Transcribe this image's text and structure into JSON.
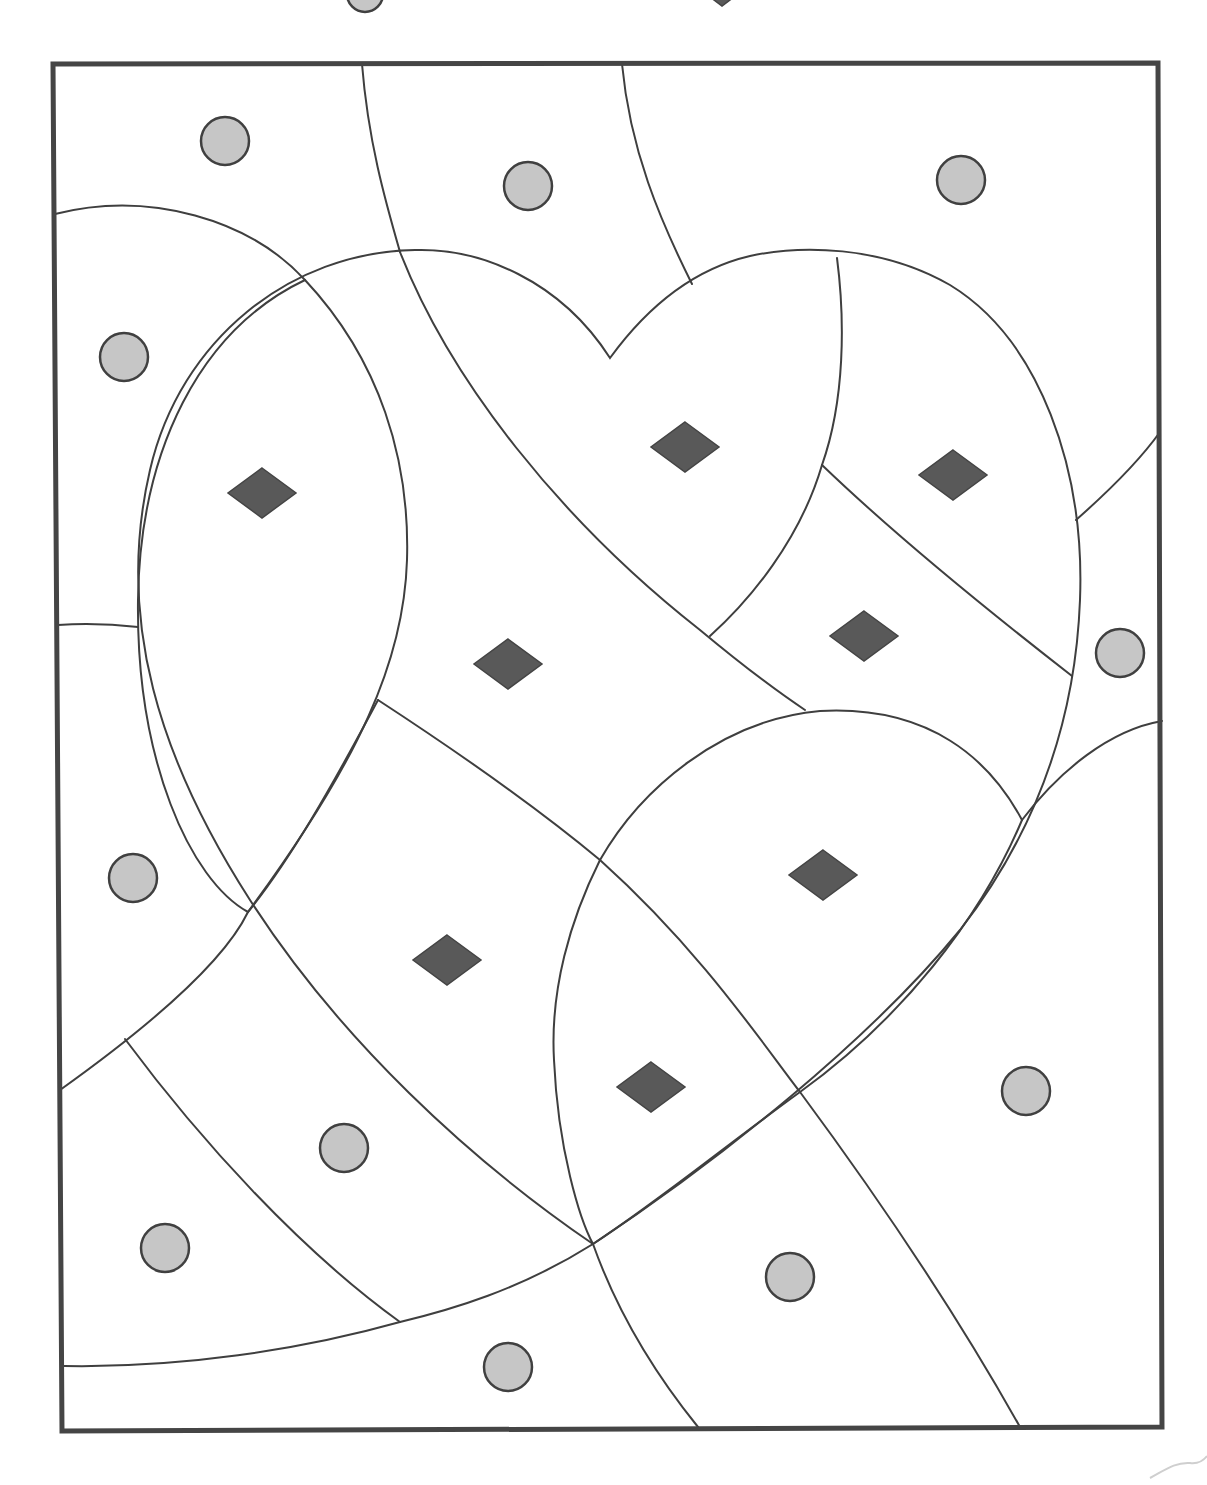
{
  "page": {
    "type": "coloring-page",
    "background": "#ffffff"
  },
  "legend_top_cropped": {
    "circle_symbol": {
      "x": 365,
      "y": -6,
      "r": 18
    },
    "diamond_symbol_tip": {
      "x": 722,
      "y": 6
    }
  },
  "colors": {
    "outline": "#3f3f3f",
    "frame": "#454545",
    "circle_fill": "#c6c6c6",
    "diamond_fill": "#595959"
  },
  "frame": {
    "points": "53,64 1158,63 1162,1427 62,1431"
  },
  "circles": [
    {
      "x": 225,
      "y": 141
    },
    {
      "x": 528,
      "y": 186
    },
    {
      "x": 961,
      "y": 180
    },
    {
      "x": 124,
      "y": 357
    },
    {
      "x": 1120,
      "y": 653
    },
    {
      "x": 133,
      "y": 878
    },
    {
      "x": 1026,
      "y": 1091
    },
    {
      "x": 344,
      "y": 1148
    },
    {
      "x": 165,
      "y": 1248
    },
    {
      "x": 790,
      "y": 1277
    },
    {
      "x": 508,
      "y": 1367
    }
  ],
  "diamonds": [
    {
      "x": 262,
      "y": 493
    },
    {
      "x": 685,
      "y": 447
    },
    {
      "x": 953,
      "y": 475
    },
    {
      "x": 508,
      "y": 664
    },
    {
      "x": 864,
      "y": 636
    },
    {
      "x": 823,
      "y": 875
    },
    {
      "x": 447,
      "y": 960
    },
    {
      "x": 651,
      "y": 1087
    }
  ],
  "shapes": {
    "heart": "M 610 358 C 560 280 480 248 415 250 C 290 252 180 340 150 470 C 115 620 160 760 250 900 C 340 1040 470 1160 593 1244 C 720 1160 870 1040 960 930 C 1030 840 1075 730 1080 600 C 1085 470 1040 340 950 285 C 880 245 800 245 750 256 C 690 270 645 310 610 358 Z",
    "leaf_left": "M 305 280 C 200 330 140 450 138 600 C 136 760 190 880 248 912 M 305 280 C 380 360 410 460 407 560 C 404 660 360 760 248 912",
    "curves": [
      "M 55 214 C 150 190 250 220 305 280",
      "M 362 64 C 368 140 385 200 400 252",
      "M 622 64 C 630 150 660 220 692 284",
      "M 400 252 C 450 380 560 520 700 630 C 760 680 790 700 805 710",
      "M 837 258 C 845 320 845 400 822 465 C 800 540 750 600 710 636",
      "M 822 465 C 900 540 1000 620 1072 676",
      "M 1076 520 C 1110 490 1140 460 1160 432",
      "M 378 700 C 470 760 540 810 600 860 C 700 950 760 1040 800 1092 C 880 1200 960 1320 1020 1427",
      "M 600 860 C 640 790 720 720 820 711 C 930 705 990 760 1022 820",
      "M 600 860 C 570 920 550 990 554 1060 C 558 1150 580 1220 593 1244 C 620 1320 660 1380 698 1427",
      "M 1022 820 C 1060 770 1110 730 1162 721",
      "M 1022 820 C 980 920 900 1020 800 1092 C 720 1150 660 1200 593 1244 C 520 1290 450 1310 400 1322 C 300 1350 180 1368 64 1366",
      "M 60 1090 C 130 1040 220 970 248 912",
      "M 125 1039 C 200 1140 300 1250 400 1322",
      "M 58 625 C 90 623 120 625 138 627",
      "M 378 700 C 330 790 290 860 248 912"
    ]
  }
}
